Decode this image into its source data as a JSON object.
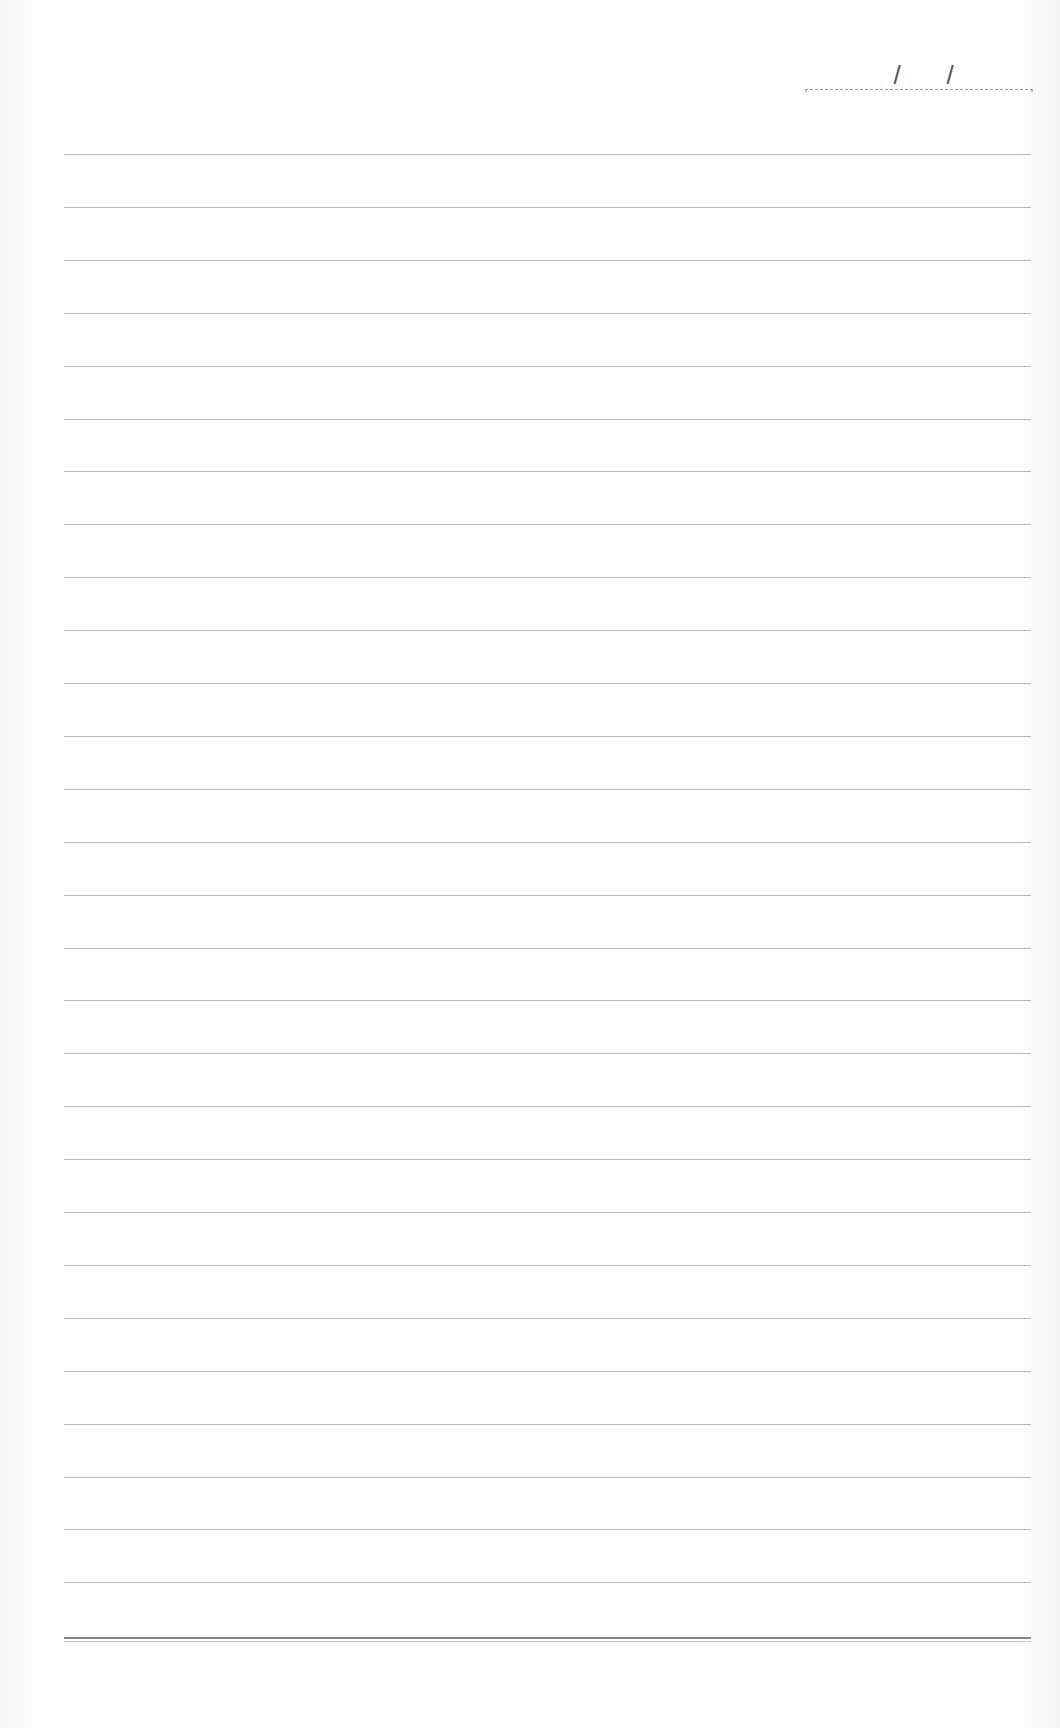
{
  "page": {
    "type": "lined-notebook-page",
    "background_color": "#fdfdfd",
    "line_color": "#b8b8b8",
    "bottom_rule_color": "#8a8a8a"
  },
  "date_field": {
    "separator_1": "/",
    "separator_2": "/",
    "value": ""
  },
  "ruled_lines": {
    "count": 28,
    "first_y": 154,
    "spacing": 52.9,
    "left": 64,
    "right": 1031,
    "bottom_rule_y": 1637
  }
}
